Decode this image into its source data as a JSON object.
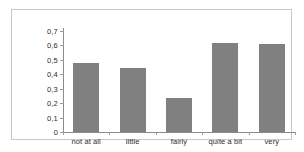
{
  "chart_data": {
    "type": "bar",
    "title": "",
    "subtitle": "",
    "xlabel": "",
    "ylabel": "",
    "categories": [
      "not at all",
      "little",
      "fairly",
      "quite a bit",
      "very"
    ],
    "values": [
      0.48,
      0.445,
      0.235,
      0.615,
      0.61
    ],
    "ylim": [
      0,
      0.7
    ],
    "ytick_values": [
      0,
      0.1,
      0.2,
      0.3,
      0.4,
      0.5,
      0.6,
      0.7
    ],
    "ytick_labels": [
      "0",
      "0,1",
      "0,2",
      "0,3",
      "0,4",
      "0,5",
      "0,6",
      "0,7"
    ],
    "decimal_separator": ",",
    "grid": false,
    "legend": null,
    "bar_color": "#808080",
    "axis_color": "#8c8c8c",
    "frame_color": "#c8c8c8",
    "background_color": "#ffffff"
  }
}
